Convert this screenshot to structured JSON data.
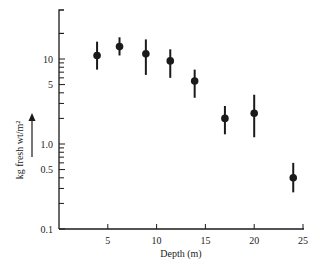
{
  "chart_data": {
    "type": "scatter",
    "title": "",
    "xlabel": "Depth (m)",
    "ylabel": "kg fresh wt/m²",
    "x_scale": "linear",
    "y_scale": "log",
    "xlim": [
      0,
      25
    ],
    "ylim": [
      0.1,
      30
    ],
    "x_ticks": [
      5,
      10,
      15,
      20,
      25
    ],
    "x_tick_labels": [
      "5",
      "10",
      "15",
      "20",
      "25"
    ],
    "y_tick_labels": [
      {
        "value": 0.1,
        "label": "0.1"
      },
      {
        "value": 0.5,
        "label": "0.5"
      },
      {
        "value": 1.0,
        "label": "1.0"
      },
      {
        "value": 5,
        "label": "5"
      },
      {
        "value": 10,
        "label": "10"
      }
    ],
    "grid": false,
    "legend": null,
    "series": [
      {
        "name": "biomass",
        "marker": "filled-circle",
        "error_bars": true,
        "points": [
          {
            "x": 3.9,
            "y": 11,
            "y_low": 7.5,
            "y_high": 16
          },
          {
            "x": 6.2,
            "y": 14,
            "y_low": 11,
            "y_high": 18
          },
          {
            "x": 8.9,
            "y": 11.5,
            "y_low": 6.5,
            "y_high": 17
          },
          {
            "x": 11.4,
            "y": 9.5,
            "y_low": 6,
            "y_high": 13
          },
          {
            "x": 13.9,
            "y": 5.5,
            "y_low": 3.5,
            "y_high": 7.5
          },
          {
            "x": 17.0,
            "y": 2.0,
            "y_low": 1.3,
            "y_high": 2.8
          },
          {
            "x": 20.0,
            "y": 2.3,
            "y_low": 1.2,
            "y_high": 3.8
          },
          {
            "x": 24.0,
            "y": 0.4,
            "y_low": 0.27,
            "y_high": 0.6
          }
        ]
      }
    ],
    "annotations": [
      "upward arrow beside y-axis label"
    ]
  },
  "colors": {
    "ink": "#1a1a1a",
    "background": "#ffffff"
  }
}
